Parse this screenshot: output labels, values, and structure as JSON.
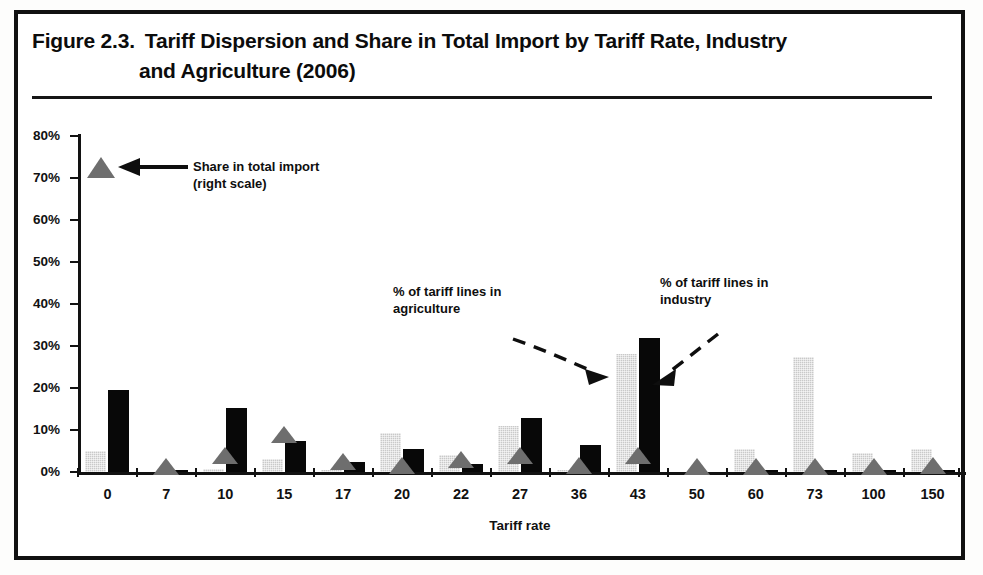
{
  "figure": {
    "number": "Figure 2.3.",
    "title_line1": "Tariff Dispersion and Share in Total Import by Tariff Rate, Industry",
    "title_line2": "and Agriculture (2006)"
  },
  "annotations": {
    "legend_marker": {
      "line1": "Share in total import",
      "line2": "(right scale)",
      "icon": "triangle-marker",
      "arrow": "left-arrow-solid"
    },
    "agriculture": {
      "line1": "% of tariff lines in",
      "line2": "agriculture",
      "arrow": "dashed-arrow-right"
    },
    "industry": {
      "line1": "% of tariff lines in",
      "line2": "industry",
      "arrow": "dashed-arrow-down-left"
    }
  },
  "colors": {
    "agriculture_bar": "#c9c9c9",
    "industry_bar": "#080808",
    "share_marker": "#6e6e6e",
    "axis": "#121212",
    "border": "#111111"
  },
  "chart_data": {
    "type": "bar",
    "title": "Tariff Dispersion and Share in Total Import by Tariff Rate, Industry and Agriculture (2006)",
    "xlabel": "Tariff rate",
    "ylabel": "",
    "ylim": [
      0,
      80
    ],
    "ytick_labels": [
      "0%",
      "10%",
      "20%",
      "30%",
      "40%",
      "50%",
      "60%",
      "70%",
      "80%"
    ],
    "ytick_values": [
      0,
      10,
      20,
      30,
      40,
      50,
      60,
      70,
      80
    ],
    "grid": false,
    "legend_position": "inside-top-left",
    "categories": [
      "0",
      "7",
      "10",
      "15",
      "17",
      "20",
      "22",
      "27",
      "36",
      "43",
      "50",
      "60",
      "73",
      "100",
      "150"
    ],
    "series": [
      {
        "name": "% of tariff lines in agriculture",
        "type": "bar",
        "color": "#c9c9c9",
        "values": [
          5.0,
          0.0,
          0.6,
          3.0,
          0.5,
          9.3,
          4.0,
          11.0,
          0.4,
          28.0,
          0.0,
          5.5,
          27.5,
          4.5,
          5.5
        ]
      },
      {
        "name": "% of tariff lines in industry",
        "type": "bar",
        "color": "#080808",
        "values": [
          19.5,
          0.4,
          15.3,
          7.5,
          2.5,
          5.5,
          2.0,
          12.8,
          6.5,
          32.0,
          0.0,
          0.5,
          0.5,
          0.5,
          0.5
        ]
      },
      {
        "name": "Share in total import (right scale)",
        "type": "marker-triangle",
        "color": "#6e6e6e",
        "values": [
          0.0,
          1.3,
          4.0,
          9.0,
          2.5,
          1.5,
          3.0,
          4.0,
          1.5,
          4.0,
          1.2,
          1.2,
          1.3,
          1.2,
          1.5
        ]
      }
    ]
  }
}
